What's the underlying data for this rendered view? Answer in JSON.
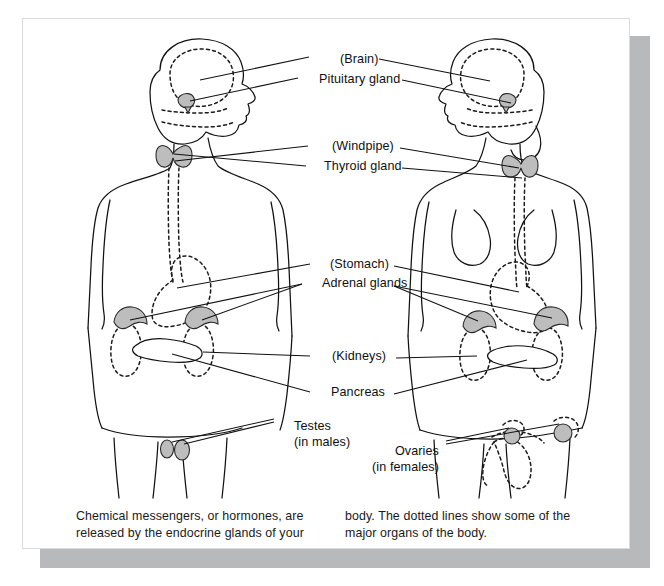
{
  "figure": {
    "panel_background": "#ffffff",
    "shadow_color": "#b7b9ba",
    "gland_fill": "#bdbdbd",
    "line_color": "#111111"
  },
  "labels": [
    {
      "id": "brain",
      "text": "(Brain)",
      "sub": "",
      "x": 318,
      "y": 45,
      "anchor": "start"
    },
    {
      "id": "pituitary",
      "text": "Pituitary gland",
      "sub": "",
      "x": 297,
      "y": 65,
      "anchor": "start"
    },
    {
      "id": "windpipe",
      "text": "(Windpipe)",
      "sub": "",
      "x": 310,
      "y": 132,
      "anchor": "start"
    },
    {
      "id": "thyroid",
      "text": "Thyroid gland",
      "sub": "",
      "x": 302,
      "y": 152,
      "anchor": "start"
    },
    {
      "id": "stomach",
      "text": "(Stomach)",
      "sub": "",
      "x": 308,
      "y": 250,
      "anchor": "start"
    },
    {
      "id": "adrenal-glands",
      "text": "Adrenal glands",
      "sub": "",
      "x": 300,
      "y": 269,
      "anchor": "start"
    },
    {
      "id": "kidneys",
      "text": "(Kidneys)",
      "sub": "",
      "x": 310,
      "y": 342,
      "anchor": "start"
    },
    {
      "id": "pancreas",
      "text": "Pancreas",
      "sub": "",
      "x": 309,
      "y": 378,
      "anchor": "start"
    },
    {
      "id": "testes",
      "text": "Testes",
      "sub": "(in males)",
      "x": 272,
      "y": 412,
      "anchor": "start"
    },
    {
      "id": "ovaries",
      "text": "Ovaries",
      "sub": "(in females)",
      "x": 417,
      "y": 437,
      "anchor": "end"
    }
  ],
  "caption": {
    "left": "Chemical messengers, or hormones, are released by the endocrine glands of your",
    "right": "body. The dotted lines show some of the major organs of the body."
  },
  "figures": [
    {
      "id": "male-figure",
      "label": "male body outline, facing right"
    },
    {
      "id": "female-figure",
      "label": "female body outline, facing left"
    }
  ]
}
